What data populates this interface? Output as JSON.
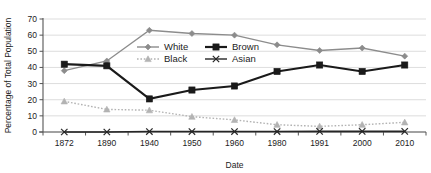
{
  "chart_data": {
    "type": "line",
    "title": "",
    "xlabel": "Date",
    "ylabel": "Percentage of Total Population",
    "categories": [
      "1872",
      "1890",
      "1940",
      "1950",
      "1960",
      "1980",
      "1991",
      "2000",
      "2010"
    ],
    "ylim": [
      0,
      70
    ],
    "yticks": [
      0,
      10,
      20,
      30,
      40,
      50,
      60,
      70
    ],
    "grid": true,
    "legend_position": "inside-upper-left",
    "series": [
      {
        "name": "White",
        "marker": "diamond",
        "line_style": "solid",
        "color": "#8c8c8c",
        "values": [
          38,
          44,
          63,
          61,
          60,
          54,
          50.5,
          52,
          47
        ]
      },
      {
        "name": "Brown",
        "marker": "square",
        "line_style": "solid",
        "color": "#1a1a1a",
        "values": [
          42,
          41,
          20.5,
          26,
          28.5,
          37.5,
          41.5,
          37.5,
          41.5
        ]
      },
      {
        "name": "Black",
        "marker": "triangle",
        "line_style": "dotted",
        "color": "#b3b3b3",
        "values": [
          19,
          14,
          13.5,
          9.5,
          7.5,
          4.5,
          3.5,
          4.5,
          6
        ]
      },
      {
        "name": "Asian",
        "marker": "x",
        "line_style": "solid",
        "color": "#262626",
        "values": [
          0,
          0,
          0.3,
          0.3,
          0.3,
          0.3,
          0.4,
          0.4,
          0.4
        ]
      }
    ]
  },
  "legend": {
    "entries": [
      {
        "label": "White"
      },
      {
        "label": "Brown"
      },
      {
        "label": "Black"
      },
      {
        "label": "Asian"
      }
    ]
  }
}
